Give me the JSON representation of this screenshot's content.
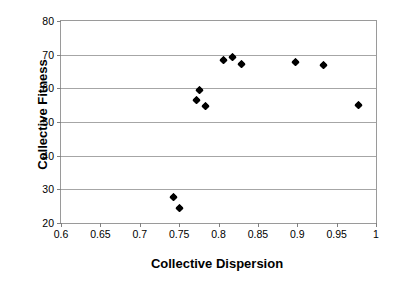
{
  "chart_data": {
    "type": "scatter",
    "title": "",
    "xlabel": "Collective Dispersion",
    "ylabel": "Collective Fitness",
    "xlim": [
      0.6,
      1.0
    ],
    "ylim": [
      20,
      80
    ],
    "xticks": [
      "0.6",
      "0.65",
      "0.7",
      "0.75",
      "0.8",
      "0.85",
      "0.9",
      "0.95",
      "1"
    ],
    "xtick_values": [
      0.6,
      0.65,
      0.7,
      0.75,
      0.8,
      0.85,
      0.9,
      0.95,
      1.0
    ],
    "yticks": [
      "20",
      "30",
      "40",
      "50",
      "60",
      "70",
      "80"
    ],
    "ytick_values": [
      20,
      30,
      40,
      50,
      60,
      70,
      80
    ],
    "grid": "horizontal",
    "legend": "none",
    "marker": "filled-diamond",
    "marker_color": "#000000",
    "series": [
      {
        "name": "Collective Fitness",
        "points": [
          {
            "x": 0.743,
            "y": 28.0
          },
          {
            "x": 0.75,
            "y": 24.5
          },
          {
            "x": 0.772,
            "y": 56.6
          },
          {
            "x": 0.776,
            "y": 59.8
          },
          {
            "x": 0.783,
            "y": 54.8
          },
          {
            "x": 0.806,
            "y": 68.7
          },
          {
            "x": 0.818,
            "y": 69.6
          },
          {
            "x": 0.829,
            "y": 67.4
          },
          {
            "x": 0.898,
            "y": 68.0
          },
          {
            "x": 0.933,
            "y": 67.0
          },
          {
            "x": 0.978,
            "y": 55.3
          }
        ]
      }
    ]
  },
  "figure": {
    "background": "#ffffff",
    "grid_color": "#a6a6a6",
    "axis_color": "#9a9a9a"
  }
}
